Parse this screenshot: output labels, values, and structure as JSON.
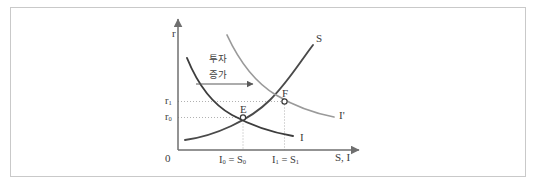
{
  "figure": {
    "kind": "economics-diagram",
    "frame_border_color": "#c9c9c9",
    "background_color": "#ffffff"
  },
  "axes": {
    "y_label": "r",
    "x_label": "S, I",
    "origin_label": "0",
    "axis_color": "#6f6f6f"
  },
  "curves": [
    {
      "id": "s-curve",
      "label": "S",
      "color": "#4a4a4a",
      "shape": "upward-sloping"
    },
    {
      "id": "i-curve",
      "label": "I",
      "color": "#3d3d3d",
      "shape": "downward-sloping"
    },
    {
      "id": "i-prime-curve",
      "label": "I'",
      "color": "#9a9a9a",
      "shape": "downward-sloping-shifted-right"
    }
  ],
  "points": [
    {
      "id": "point-e",
      "label": "E",
      "marker": "open-circle"
    },
    {
      "id": "point-f",
      "label": "F",
      "marker": "open-circle"
    }
  ],
  "y_ticks": [
    {
      "id": "r0",
      "base": "r",
      "sub": "0"
    },
    {
      "id": "r1",
      "base": "r",
      "sub": "1"
    }
  ],
  "x_ticks": [
    {
      "id": "x0",
      "lhs_base": "I",
      "lhs_sub": "0",
      "eq": " = ",
      "rhs_base": "S",
      "rhs_sub": "0"
    },
    {
      "id": "x1",
      "lhs_base": "I",
      "lhs_sub": "1",
      "eq": " = ",
      "rhs_base": "S",
      "rhs_sub": "1"
    }
  ],
  "annotation": {
    "line1": "투자",
    "line2": "증가",
    "arrow": "rightward-shift-arrow"
  },
  "guides": {
    "style": "dotted",
    "color": "#9d9d9d"
  }
}
